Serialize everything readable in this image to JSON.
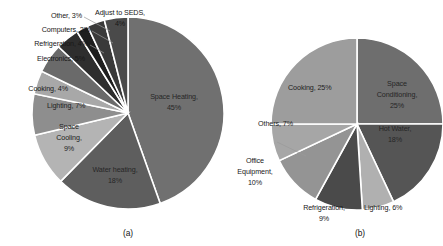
{
  "figure": {
    "background": "#ffffff",
    "panels": [
      {
        "caption": "(a)"
      },
      {
        "caption": "(b)"
      }
    ]
  },
  "chart_data": [
    {
      "type": "pie",
      "title": "",
      "caption": "(a)",
      "units": "percent",
      "legend": "none",
      "labels_position": "outside-and-inside",
      "categories": [
        "Space Heating",
        "Water heating",
        "Space Cooling",
        "Lighting",
        "Cooking",
        "Electronics",
        "Refrigeration",
        "Computers",
        "Other",
        "Adjust to SEDS"
      ],
      "values": [
        45,
        18,
        9,
        7,
        4,
        5,
        4,
        2,
        3,
        4
      ],
      "labels": [
        "Space Heating, 45%",
        "Water heating, 18%",
        "Space Cooling, 9%",
        "Lighting, 7%",
        "Cooking, 4%",
        "Electronics, 5%",
        "Refrigeration, 4%",
        "Computers, 2%",
        "Other, 3%",
        "Adjust to SEDS, 4%"
      ],
      "colors": [
        "#707070",
        "#5e5e5e",
        "#b4b4b4",
        "#8e8e8e",
        "#a8a8a8",
        "#6a6a6a",
        "#2e2e2e",
        "#1e1e1e",
        "#3a3a3a",
        "#4a4a4a"
      ]
    },
    {
      "type": "pie",
      "title": "",
      "caption": "(b)",
      "units": "percent",
      "legend": "none",
      "labels_position": "outside-and-inside",
      "categories": [
        "Space Conditioning",
        "Hot Water",
        "Lighting",
        "Refrigeration",
        "Office Equipment",
        "Others",
        "Cooking"
      ],
      "values": [
        25,
        18,
        6,
        9,
        10,
        7,
        25
      ],
      "labels": [
        "Space Conditioning, 25%",
        "Hot Water, 18%",
        "Lighting, 6%",
        "Refrigeration, 9%",
        "Office Equipment, 10%",
        "Others, 7%",
        "Cooking, 25%"
      ],
      "colors": [
        "#6e6e6e",
        "#555555",
        "#b0b0b0",
        "#4a4a4a",
        "#949494",
        "#a6a6a6",
        "#9d9d9d"
      ]
    }
  ],
  "panel_a": {
    "caption": "(a)",
    "labels": {
      "other": "Other, 3%",
      "computers": "Computers, 2%",
      "refrigeration": "Refrigeration, 4%",
      "electronics": "Electronics, 5%",
      "cooking": "Cooking, 4%",
      "adjust_to_seds_line1": "Adjust to SEDS,",
      "adjust_to_seds_line2": "4%",
      "lighting": "Lighting, 7%",
      "space_cooling_line1": "Space",
      "space_cooling_line2": "Cooling,",
      "space_cooling_line3": "9%",
      "water_heating_line1": "Water heating,",
      "water_heating_line2": "18%",
      "space_heating_line1": "Space Heating,",
      "space_heating_line2": "45%"
    }
  },
  "panel_b": {
    "caption": "(b)",
    "labels": {
      "cooking": "Cooking, 25%",
      "space_conditioning_line1": "Space",
      "space_conditioning_line2": "Conditioning,",
      "space_conditioning_line3": "25%",
      "hot_water_line1": "Hot Water,",
      "hot_water_line2": "18%",
      "lighting": "Lighting, 6%",
      "refrigeration_line1": "Refrigeration,",
      "refrigeration_line2": "9%",
      "office_equipment_line1": "Office",
      "office_equipment_line2": "Equipment,",
      "office_equipment_line3": "10%",
      "others": "Others, 7%"
    }
  }
}
